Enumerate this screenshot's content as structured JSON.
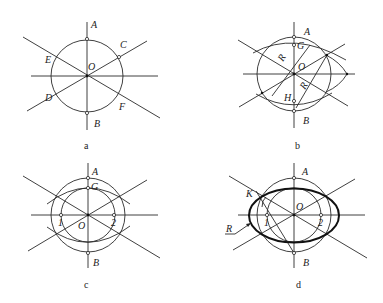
{
  "panels": [
    {
      "id": "a",
      "caption": "a",
      "labels": {
        "A": "A",
        "B": "B",
        "C": "C",
        "D": "D",
        "E": "E",
        "F": "F",
        "O": "O"
      }
    },
    {
      "id": "b",
      "caption": "b",
      "labels": {
        "A": "A",
        "B": "B",
        "G": "G",
        "H": "H",
        "O": "O",
        "R1": "R",
        "R2": "R"
      }
    },
    {
      "id": "c",
      "caption": "c",
      "labels": {
        "A": "A",
        "B": "B",
        "G": "G",
        "O": "O",
        "p1": "1",
        "p2": "2"
      }
    },
    {
      "id": "d",
      "caption": "d",
      "labels": {
        "A": "A",
        "B": "B",
        "K": "K",
        "O": "O",
        "p1": "1",
        "p2": "2",
        "R": "R"
      }
    }
  ],
  "colors": {
    "line": "#2a2a2a",
    "background": "#ffffff"
  }
}
